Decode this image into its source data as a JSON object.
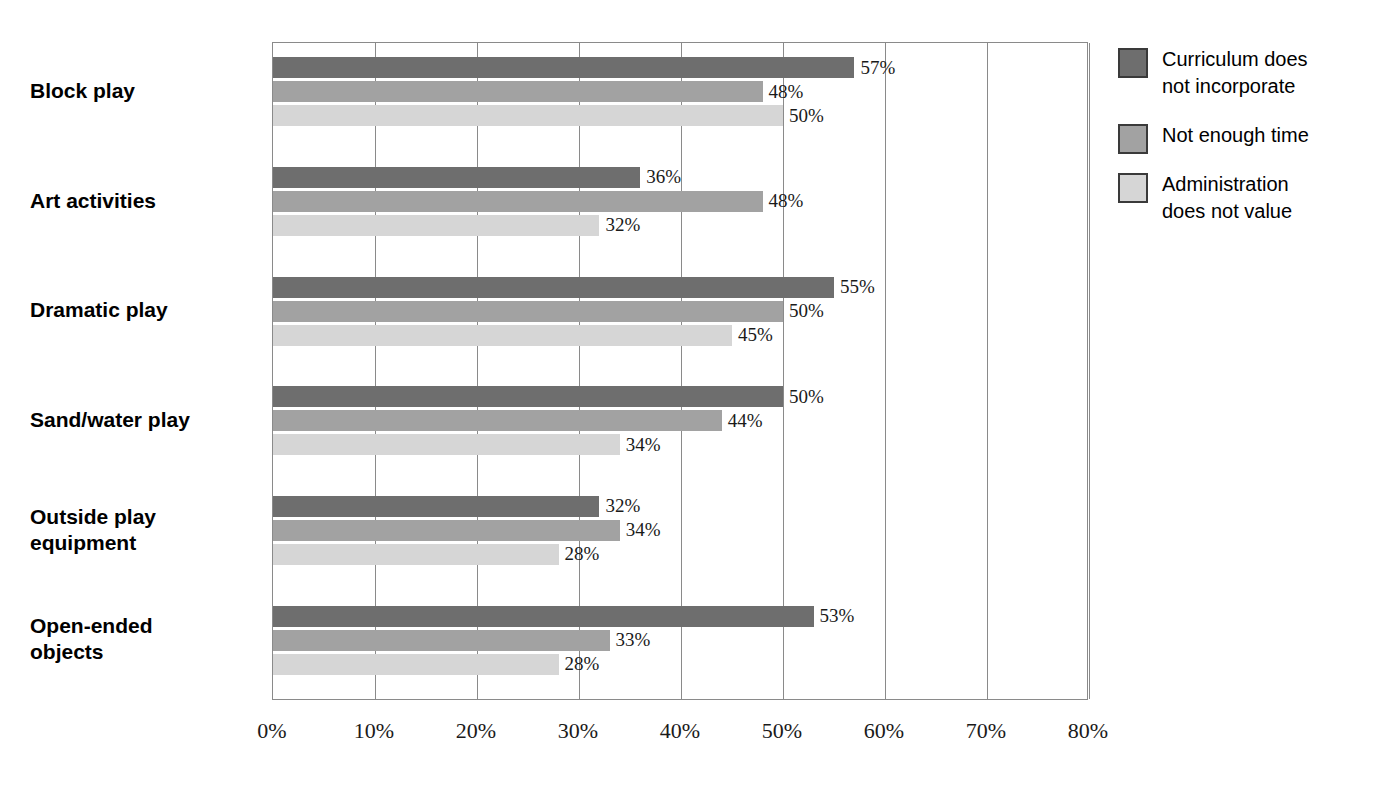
{
  "chart_data": {
    "type": "bar",
    "orientation": "horizontal",
    "title": "",
    "subtitle": "",
    "xlabel": "",
    "ylabel": "",
    "xlim": [
      0,
      80
    ],
    "xunit": "%",
    "grid": true,
    "legend_position": "right",
    "xticks": [
      "0%",
      "10%",
      "20%",
      "30%",
      "40%",
      "50%",
      "60%",
      "70%",
      "80%"
    ],
    "xtick_values": [
      0,
      10,
      20,
      30,
      40,
      50,
      60,
      70,
      80
    ],
    "categories": [
      "Block play",
      "Art activities",
      "Dramatic play",
      "Sand/water play",
      "Outside play\nequipment",
      "Open-ended\nobjects"
    ],
    "series": [
      {
        "name": "Curriculum does\nnot incorporate",
        "color": "#6e6e6e",
        "values": [
          57,
          36,
          55,
          50,
          32,
          53
        ],
        "labels": [
          "57%",
          "36%",
          "55%",
          "50%",
          "32%",
          "53%"
        ]
      },
      {
        "name": "Not enough time",
        "color": "#a2a2a2",
        "values": [
          48,
          48,
          50,
          44,
          34,
          33
        ],
        "labels": [
          "48%",
          "48%",
          "50%",
          "44%",
          "34%",
          "33%"
        ]
      },
      {
        "name": "Administration\ndoes not value",
        "color": "#d6d6d6",
        "values": [
          50,
          32,
          45,
          34,
          28,
          28
        ],
        "labels": [
          "50%",
          "32%",
          "45%",
          "34%",
          "28%",
          "28%"
        ]
      }
    ]
  },
  "legend": {
    "items": [
      {
        "label": "Curriculum does\nnot incorporate",
        "color": "#6e6e6e"
      },
      {
        "label": "Not enough time",
        "color": "#a2a2a2"
      },
      {
        "label": "Administration\ndoes not value",
        "color": "#d6d6d6"
      }
    ]
  },
  "axis": {
    "border_color": "#8a8a8a"
  }
}
